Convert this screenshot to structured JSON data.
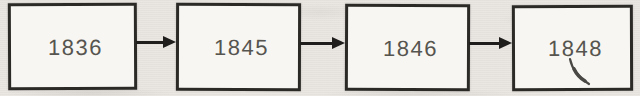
{
  "diagram": {
    "type": "flowchart",
    "direction": "left-to-right",
    "nodes": [
      {
        "label": "1836"
      },
      {
        "label": "1845"
      },
      {
        "label": "1846"
      },
      {
        "label": "1848"
      }
    ],
    "connections": [
      {
        "from": "1836",
        "to": "1845",
        "style": "solid-right-arrow"
      },
      {
        "from": "1845",
        "to": "1846",
        "style": "solid-right-arrow"
      },
      {
        "from": "1846",
        "to": "1848",
        "style": "solid-right-arrow"
      }
    ],
    "colors": {
      "page_background": "#e9e6e2",
      "node_fill": "#f7f6f2",
      "node_border": "#2c2a27",
      "label_text": "#56544f",
      "arrow": "#1f1e1c"
    },
    "marks": [
      {
        "name": "pen-mark",
        "location": "below-right of 1848 label"
      }
    ]
  }
}
